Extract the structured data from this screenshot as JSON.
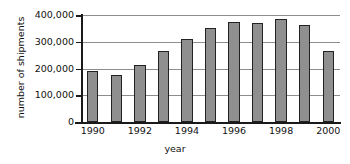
{
  "chart_data": {
    "type": "bar",
    "title": "",
    "xlabel": "year",
    "ylabel": "number of shipments",
    "categories": [
      "1990",
      "1991",
      "1992",
      "1993",
      "1994",
      "1995",
      "1996",
      "1997",
      "1998",
      "1999",
      "2000"
    ],
    "values": [
      190000,
      175000,
      213000,
      267000,
      311000,
      350000,
      375000,
      369000,
      385000,
      364000,
      267000
    ],
    "ylim": [
      0,
      400000
    ],
    "ytick_values": [
      0,
      100000,
      200000,
      300000,
      400000
    ],
    "ytick_labels": [
      "0",
      "100,000",
      "200,000",
      "300,000",
      "400,000"
    ],
    "xtick_labels": [
      "1990",
      "1992",
      "1994",
      "1996",
      "1998",
      "2000"
    ],
    "xtick_categories": [
      "1990",
      "1992",
      "1994",
      "1996",
      "1998",
      "2000"
    ],
    "grid": true,
    "legend": false,
    "bar_color": "#8f8f8f",
    "bar_edge_color": "#222222",
    "axis_color": "#1a1a1a",
    "grid_color": "#8d8d8d",
    "background": "#ffffff"
  }
}
